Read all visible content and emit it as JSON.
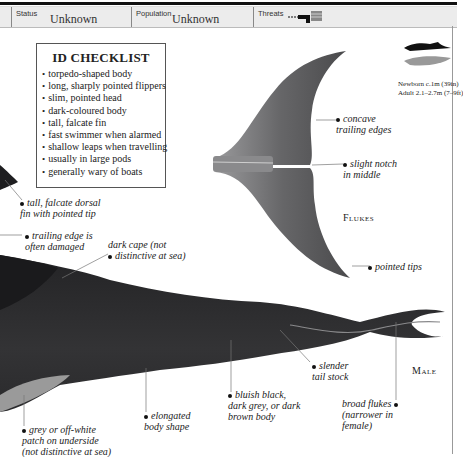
{
  "infobar": {
    "status_label": "Status",
    "status_value": "Unknown",
    "population_label": "Population",
    "population_value": "Unknown",
    "threats_label": "Threats",
    "threat_icons": [
      "fishing-net-icon",
      "pollution-icon"
    ]
  },
  "checklist": {
    "title": "ID CHECKLIST",
    "items": [
      "torpedo-shaped body",
      "long, sharply pointed flippers",
      "slim, pointed head",
      "dark-coloured body",
      "tall, falcate fin",
      "fast swimmer when alarmed",
      "shallow leaps when travelling",
      "usually in large pods",
      "generally wary of boats"
    ]
  },
  "size": {
    "newborn": "Newborn c.1m (39in)",
    "adult": "Adult 2.1–2.7m (7–9ft)"
  },
  "flukes": {
    "label": "Flukes",
    "annotations": {
      "concave": [
        "concave",
        "trailing edges"
      ],
      "notch": [
        "slight notch",
        "in middle"
      ],
      "tips": [
        "pointed tips"
      ]
    }
  },
  "body_annotations": {
    "dorsal": [
      "tall, falcate dorsal",
      "fin with pointed tip"
    ],
    "trailing": [
      "trailing edge is",
      "often damaged"
    ],
    "cape": [
      "dark cape (not",
      "distinctive at sea)"
    ],
    "tailstock": [
      "slender",
      "tail stock"
    ],
    "body_colour": [
      "bluish black,",
      "dark grey, or dark",
      "brown body"
    ],
    "broad_flukes": [
      "broad flukes",
      "(narrower in",
      "female)"
    ],
    "elongated": [
      "elongated",
      "body shape"
    ],
    "underside": [
      "grey or off-white",
      "patch on underside",
      "(not distinctive at sea)"
    ]
  },
  "male_label": "Male",
  "colors": {
    "body": "#2e2e30",
    "fluke": "#6a6a6c",
    "infobar": "#ececec"
  }
}
